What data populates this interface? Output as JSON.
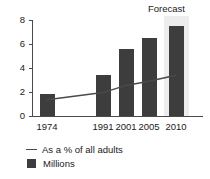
{
  "chart_data": {
    "type": "bar",
    "title": "",
    "subtitle": "",
    "xlabel": "",
    "ylabel": "",
    "categories": [
      "1974",
      "1991",
      "2001",
      "2005",
      "2010"
    ],
    "ylim": [
      0,
      8
    ],
    "yticks": [
      "0",
      "2",
      "4",
      "6",
      "8"
    ],
    "grid": false,
    "legend_position": "bottom-left",
    "series": [
      {
        "name": "Millions",
        "type": "bar",
        "color": "#3d3d3d",
        "values": [
          1.8,
          3.4,
          5.6,
          6.5,
          7.5
        ]
      },
      {
        "name": "As a % of all adults",
        "type": "line",
        "color": "#4a4a4a",
        "values": [
          1.35,
          1.95,
          2.55,
          2.9,
          3.4
        ]
      }
    ],
    "annotations": [
      {
        "label": "Forecast",
        "applies_to": "2010",
        "band_color": "#ededed"
      }
    ]
  },
  "legend": {
    "items": [
      {
        "label": "As a % of all adults",
        "marker": "line"
      },
      {
        "label": "Millions",
        "marker": "square"
      }
    ]
  },
  "colors": {
    "bar": "#3d3d3d",
    "line": "#4a4a4a",
    "axis": "#4a4a4a",
    "forecast_band": "#ededed",
    "text": "#1a1a1a",
    "background": "#ffffff"
  }
}
